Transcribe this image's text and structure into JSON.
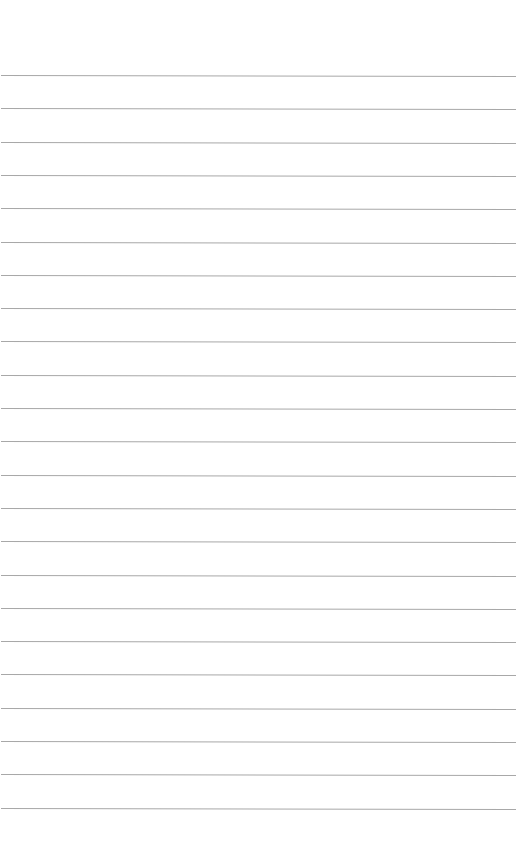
{
  "page": {
    "type": "lined-paper",
    "background_color": "#ffffff",
    "rule_color": "#a8a8a8",
    "rule_count": 23,
    "first_rule_y": 75,
    "rule_spacing": 33.3
  }
}
